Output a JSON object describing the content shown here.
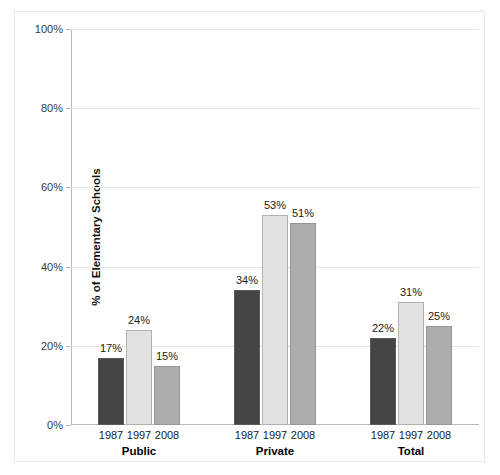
{
  "chart_data": {
    "type": "bar",
    "title": "",
    "xlabel": "",
    "ylabel": "% of Elementary Schools",
    "ylim": [
      0,
      100
    ],
    "ytick_labels": [
      "0%",
      "20%",
      "40%",
      "60%",
      "80%",
      "100%"
    ],
    "ytick_values": [
      0,
      20,
      40,
      60,
      80,
      100
    ],
    "grid": true,
    "legend": "none",
    "categories": [
      "Public",
      "Private",
      "Total"
    ],
    "series": [
      {
        "name": "1987",
        "values": [
          17,
          34,
          22
        ],
        "color": "#444446"
      },
      {
        "name": "1997",
        "values": [
          24,
          53,
          31
        ],
        "color": "#e2e2e2"
      },
      {
        "name": "2008",
        "values": [
          15,
          51,
          25
        ],
        "color": "#adadad"
      }
    ],
    "data_labels": [
      [
        "17%",
        "24%",
        "15%"
      ],
      [
        "34%",
        "53%",
        "51%"
      ],
      [
        "22%",
        "31%",
        "25%"
      ]
    ],
    "groups": [
      {
        "name": "Public",
        "bars": [
          {
            "year": "1987",
            "value": 17,
            "label": "17%",
            "color": "#444446"
          },
          {
            "year": "1997",
            "value": 24,
            "label": "24%",
            "color": "#e2e2e2"
          },
          {
            "year": "2008",
            "value": 15,
            "label": "15%",
            "color": "#adadad"
          }
        ]
      },
      {
        "name": "Private",
        "bars": [
          {
            "year": "1987",
            "value": 34,
            "label": "34%",
            "color": "#444446"
          },
          {
            "year": "1997",
            "value": 53,
            "label": "53%",
            "color": "#e2e2e2"
          },
          {
            "year": "2008",
            "value": 51,
            "label": "51%",
            "color": "#adadad"
          }
        ]
      },
      {
        "name": "Total",
        "bars": [
          {
            "year": "1987",
            "value": 22,
            "label": "22%",
            "color": "#444446"
          },
          {
            "year": "1997",
            "value": 31,
            "label": "31%",
            "color": "#e2e2e2"
          },
          {
            "year": "2008",
            "value": 25,
            "label": "25%",
            "color": "#adadad"
          }
        ]
      }
    ],
    "axis_color": "#b8b8b8",
    "grid_color": "#e6e6e6",
    "frame_color": "#e8e8e8"
  }
}
